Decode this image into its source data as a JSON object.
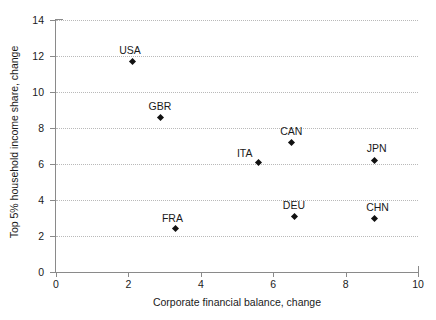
{
  "chart_data": {
    "type": "scatter",
    "title": "",
    "xlabel": "Corporate financial balance, change",
    "ylabel": "Top 5% household income share, change",
    "xlim": [
      0,
      10
    ],
    "ylim": [
      0,
      14
    ],
    "xticks": [
      "0",
      "2",
      "4",
      "6",
      "8",
      "10"
    ],
    "yticks": [
      "0",
      "2",
      "4",
      "6",
      "8",
      "10",
      "12",
      "14"
    ],
    "grid": "horizontal-dotted",
    "legend": "none",
    "points": [
      {
        "label": "USA",
        "x": 2.1,
        "y": 11.7,
        "label_dx": -2,
        "label_dy": -16
      },
      {
        "label": "GBR",
        "x": 2.9,
        "y": 8.6,
        "label_dx": -1,
        "label_dy": -16
      },
      {
        "label": "FRA",
        "x": 3.3,
        "y": 2.4,
        "label_dx": -3,
        "label_dy": -16
      },
      {
        "label": "ITA",
        "x": 5.6,
        "y": 6.1,
        "label_dx": -14,
        "label_dy": -14
      },
      {
        "label": "CAN",
        "x": 6.5,
        "y": 7.2,
        "label_dx": 0,
        "label_dy": -16
      },
      {
        "label": "DEU",
        "x": 6.6,
        "y": 3.1,
        "label_dx": -1,
        "label_dy": -16
      },
      {
        "label": "JPN",
        "x": 8.8,
        "y": 6.2,
        "label_dx": 2,
        "label_dy": -17
      },
      {
        "label": "CHN",
        "x": 8.8,
        "y": 3.0,
        "label_dx": 3,
        "label_dy": -16
      }
    ]
  }
}
